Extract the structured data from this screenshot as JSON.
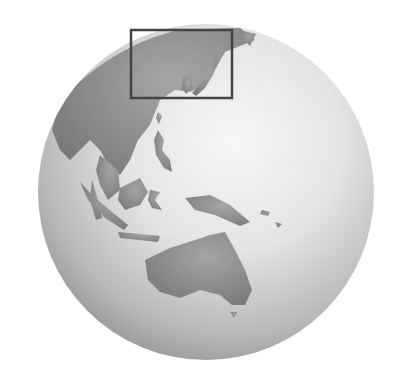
{
  "map": {
    "type": "globe-locator",
    "view": "Orthographic globe centered on Southeast Asia / Western Pacific",
    "regions_visible": [
      "East Asia",
      "Southeast Asia",
      "Indonesia",
      "Philippines",
      "New Guinea",
      "Australia"
    ],
    "highlight_box": {
      "label": "Locator rectangle over East Asia (Korea / Japan region)",
      "x": 131,
      "y": 30,
      "width": 101,
      "height": 68
    },
    "colors": {
      "land": "#7a7a7a",
      "ocean_light": "#f2f2f2",
      "ocean_shadow": "#9a9a9a",
      "box_stroke": "#444444"
    }
  }
}
